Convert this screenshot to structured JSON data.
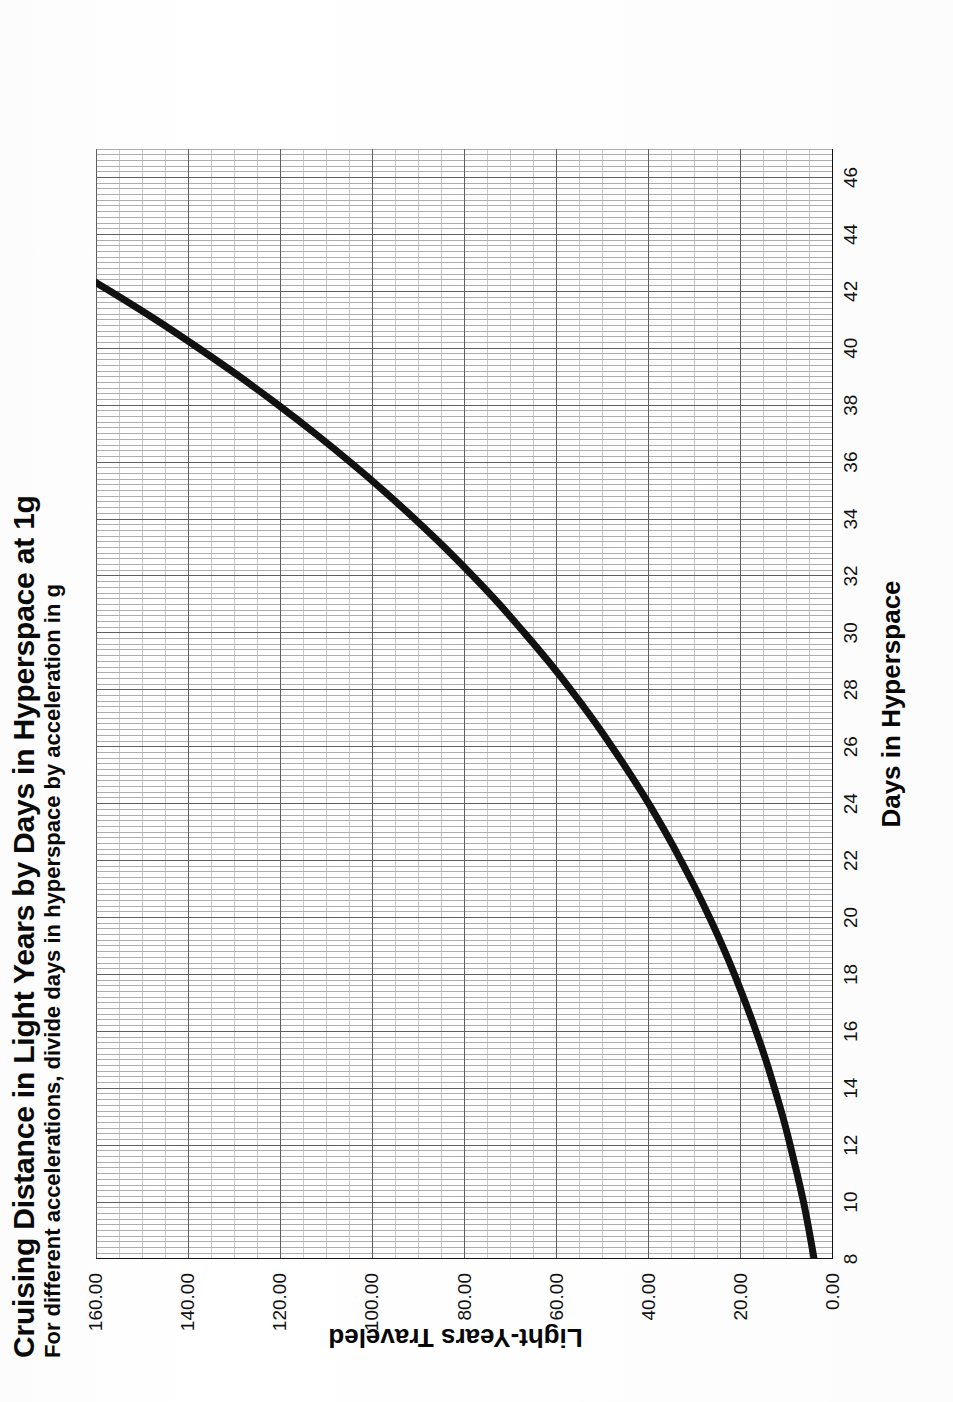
{
  "chart_data": {
    "type": "line",
    "title": "Cruising Distance in Light Years by Days in Hyperspace at 1g",
    "subtitle": "For different accelerations, divide days in hyperspace by acceleration in g",
    "xlabel": "Days in Hyperspace",
    "ylabel": "Light-Years Traveled",
    "xlim": [
      8,
      47
    ],
    "ylim": [
      0,
      160
    ],
    "grid": true,
    "legend": false,
    "legend_position": "none",
    "xticks": [
      8,
      10,
      12,
      14,
      16,
      18,
      20,
      22,
      24,
      26,
      28,
      30,
      32,
      34,
      36,
      38,
      40,
      42,
      44,
      46
    ],
    "xticklabels": [
      "8",
      "10",
      "12",
      "14",
      "16",
      "18",
      "20",
      "22",
      "24",
      "26",
      "28",
      "30",
      "32",
      "34",
      "36",
      "38",
      "40",
      "42",
      "44",
      "46"
    ],
    "yticks": [
      0,
      20,
      40,
      60,
      80,
      100,
      120,
      140,
      160
    ],
    "yticklabels": [
      "0.00",
      "20.00",
      "40.00",
      "60.00",
      "80.00",
      "100.00",
      "120.00",
      "140.00",
      "160.00"
    ],
    "x": [
      8,
      9,
      10,
      11,
      12,
      13,
      14,
      15,
      16,
      17,
      18,
      19,
      20,
      21,
      22,
      23,
      24,
      25,
      26,
      27,
      28,
      29,
      30,
      31,
      32,
      33,
      34,
      35,
      36,
      37,
      38,
      39,
      40,
      41,
      42,
      43,
      44,
      45,
      46
    ],
    "series": [
      {
        "name": "Distance at 1g",
        "color": "#111111",
        "linewidth": 7,
        "values": [
          4.1,
          5.2,
          6.4,
          7.8,
          9.3,
          10.9,
          12.7,
          14.6,
          16.7,
          19.0,
          21.4,
          24.0,
          26.8,
          29.8,
          33.0,
          36.4,
          40.0,
          43.9,
          48.0,
          52.3,
          56.9,
          61.8,
          67.0,
          72.4,
          78.2,
          84.3,
          90.8,
          97.6,
          104.8,
          112.4,
          120.4,
          128.8,
          137.7,
          147.0,
          156.9,
          167.2,
          178.1,
          189.6,
          201.6
        ]
      }
    ]
  },
  "axes": {
    "x_axis_name": "Days in Hyperspace",
    "y_axis_name": "Light-Years Traveled"
  }
}
